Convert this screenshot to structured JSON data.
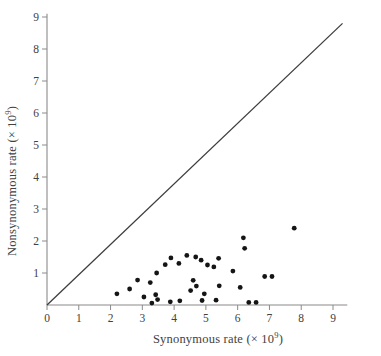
{
  "figure": {
    "background": "#ffffff",
    "axis_color": "#8a8a8a",
    "tick_color": "#8a8a8a",
    "text_color": "#414141",
    "line_color": "#3d3d3d",
    "point_color": "#151515"
  },
  "chart_data": {
    "type": "scatter",
    "title": "",
    "xlabel": "Synonymous rate (× 10^9)",
    "ylabel": "Nonsynonymous rate (× 10^9)",
    "xlabel_parts": {
      "main": "Synonymous rate (× 10",
      "exp": "9",
      "suffix": ")"
    },
    "ylabel_parts": {
      "main": "Nonsynonymous rate (× 10",
      "exp": "9",
      "suffix": ")"
    },
    "xlim": [
      0,
      9.45
    ],
    "ylim": [
      0,
      9.1
    ],
    "xticks": [
      0,
      1,
      2,
      3,
      4,
      5,
      6,
      7,
      8,
      9
    ],
    "yticks": [
      1,
      2,
      3,
      4,
      5,
      6,
      7,
      8,
      9
    ],
    "grid": false,
    "legend": null,
    "identity_line": {
      "x1": 0,
      "y1": 0,
      "x2": 9.3,
      "y2": 8.8
    },
    "point_radius_px": 2.4,
    "points": [
      [
        2.2,
        0.35
      ],
      [
        2.6,
        0.5
      ],
      [
        2.85,
        0.78
      ],
      [
        3.05,
        0.25
      ],
      [
        3.25,
        0.7
      ],
      [
        3.3,
        0.06
      ],
      [
        3.42,
        0.32
      ],
      [
        3.48,
        0.17
      ],
      [
        3.45,
        1.0
      ],
      [
        3.72,
        1.26
      ],
      [
        3.88,
        0.1
      ],
      [
        3.9,
        1.47
      ],
      [
        4.15,
        1.3
      ],
      [
        4.18,
        0.13
      ],
      [
        4.4,
        1.55
      ],
      [
        4.52,
        0.45
      ],
      [
        4.6,
        0.77
      ],
      [
        4.68,
        1.5
      ],
      [
        4.7,
        0.59
      ],
      [
        4.85,
        1.4
      ],
      [
        4.88,
        0.14
      ],
      [
        4.95,
        0.35
      ],
      [
        5.05,
        1.25
      ],
      [
        5.25,
        1.19
      ],
      [
        5.32,
        0.15
      ],
      [
        5.4,
        1.46
      ],
      [
        5.42,
        0.6
      ],
      [
        5.85,
        1.06
      ],
      [
        6.08,
        0.55
      ],
      [
        6.18,
        2.1
      ],
      [
        6.22,
        1.77
      ],
      [
        6.35,
        0.08
      ],
      [
        6.58,
        0.08
      ],
      [
        6.85,
        0.89
      ],
      [
        7.08,
        0.89
      ],
      [
        7.78,
        2.4
      ]
    ]
  }
}
